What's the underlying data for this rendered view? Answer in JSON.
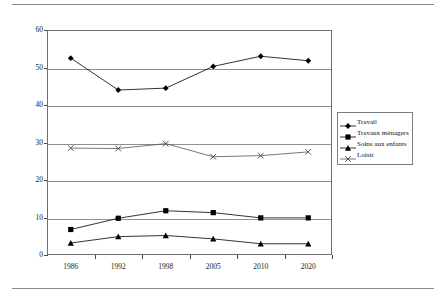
{
  "chart_data": {
    "type": "line",
    "title": "",
    "xlabel": "",
    "ylabel": "",
    "categories": [
      "1986",
      "1992",
      "1998",
      "2005",
      "2010",
      "2020"
    ],
    "ylim": [
      0,
      60
    ],
    "yticks": [
      0,
      10,
      20,
      30,
      40,
      50,
      60
    ],
    "grid": true,
    "legend_position": "right",
    "series": [
      {
        "name": "Travail",
        "marker": "diamond",
        "color": "#000000",
        "values": [
          52.5,
          44.0,
          44.5,
          50.3,
          53.0,
          51.8
        ]
      },
      {
        "name": "Travaux ménagers",
        "marker": "square",
        "color": "#000000",
        "values": [
          6.8,
          9.8,
          11.8,
          11.3,
          9.9,
          9.9
        ]
      },
      {
        "name": "Soins aux enfants",
        "marker": "triangle",
        "color": "#000000",
        "values": [
          3.2,
          4.9,
          5.2,
          4.3,
          3.0,
          3.0
        ]
      },
      {
        "name": "Loisir",
        "marker": "cross",
        "color": "#555555",
        "values": [
          28.5,
          28.4,
          29.7,
          26.2,
          26.5,
          27.5
        ]
      }
    ]
  },
  "axis": {
    "y_tick_labels": [
      "60",
      "50",
      "40",
      "30",
      "20",
      "10",
      "0"
    ],
    "x_tick_labels": [
      "1986",
      "1992",
      "1998",
      "2005",
      "2010",
      "2020"
    ]
  },
  "legend": {
    "items": [
      {
        "label": "Travail",
        "marker": "diamond-marker-icon"
      },
      {
        "label": "Travaux ménagers",
        "marker": "square-marker-icon"
      },
      {
        "label": "Soins aux enfants",
        "marker": "triangle-marker-icon"
      },
      {
        "label": "Loisir",
        "marker": "cross-marker-icon"
      }
    ]
  },
  "colors": {
    "axis": "#6e6e6e",
    "grid": "#8f8f8f",
    "ink": "#000000",
    "muted": "#555555"
  }
}
